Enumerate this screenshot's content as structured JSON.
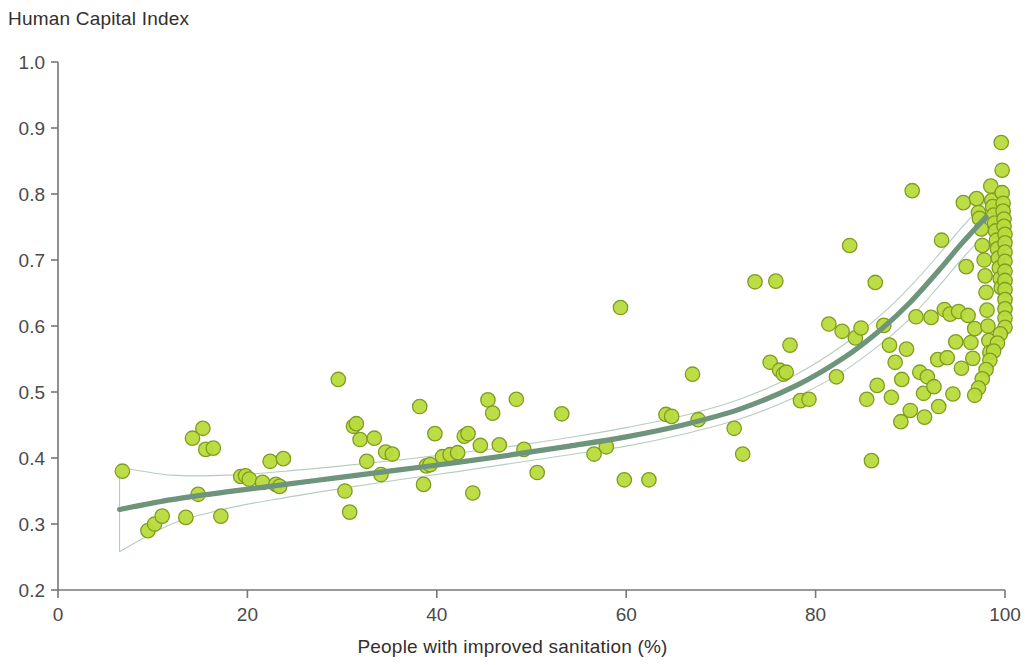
{
  "chart_data": {
    "type": "scatter",
    "title": "Human Capital Index",
    "xlabel": "People with improved sanitation (%)",
    "ylabel": "Human Capital Index",
    "xlim": [
      0,
      100
    ],
    "ylim": [
      0.2,
      1.0
    ],
    "xticks": [
      0,
      20,
      40,
      60,
      80,
      100
    ],
    "xtick_labels": [
      "0",
      "20",
      "40",
      "60",
      "80",
      "100"
    ],
    "yticks": [
      0.2,
      0.3,
      0.4,
      0.5,
      0.6,
      0.7,
      0.8,
      0.9,
      1.0
    ],
    "ytick_labels": [
      "0.2",
      "0.3",
      "0.4",
      "0.5",
      "0.6",
      "0.7",
      "0.8",
      "0.9",
      "1.0"
    ],
    "grid": false,
    "legend": null,
    "marker_fill": "#b8db3c",
    "marker_edge": "#7f9c20",
    "trend_color": "#6e947c",
    "band_color": "#a9c4b3",
    "axis_color": "#777777",
    "points": [
      [
        6.8,
        0.38
      ],
      [
        9.5,
        0.29
      ],
      [
        10.2,
        0.3
      ],
      [
        11.0,
        0.312
      ],
      [
        13.5,
        0.31
      ],
      [
        14.2,
        0.43
      ],
      [
        14.8,
        0.345
      ],
      [
        15.3,
        0.445
      ],
      [
        15.6,
        0.413
      ],
      [
        16.4,
        0.415
      ],
      [
        17.2,
        0.312
      ],
      [
        19.3,
        0.372
      ],
      [
        19.8,
        0.373
      ],
      [
        20.2,
        0.368
      ],
      [
        21.6,
        0.363
      ],
      [
        22.4,
        0.395
      ],
      [
        23.0,
        0.36
      ],
      [
        23.4,
        0.357
      ],
      [
        23.8,
        0.399
      ],
      [
        29.6,
        0.519
      ],
      [
        30.3,
        0.35
      ],
      [
        30.8,
        0.318
      ],
      [
        31.2,
        0.448
      ],
      [
        31.5,
        0.452
      ],
      [
        31.9,
        0.428
      ],
      [
        32.6,
        0.395
      ],
      [
        33.4,
        0.43
      ],
      [
        34.1,
        0.375
      ],
      [
        34.6,
        0.409
      ],
      [
        35.3,
        0.406
      ],
      [
        38.2,
        0.478
      ],
      [
        38.6,
        0.36
      ],
      [
        38.9,
        0.388
      ],
      [
        39.3,
        0.39
      ],
      [
        39.8,
        0.437
      ],
      [
        40.6,
        0.402
      ],
      [
        41.4,
        0.405
      ],
      [
        42.2,
        0.408
      ],
      [
        42.9,
        0.433
      ],
      [
        43.3,
        0.437
      ],
      [
        43.8,
        0.347
      ],
      [
        44.6,
        0.419
      ],
      [
        45.4,
        0.488
      ],
      [
        45.9,
        0.468
      ],
      [
        46.6,
        0.42
      ],
      [
        48.4,
        0.489
      ],
      [
        49.2,
        0.413
      ],
      [
        50.6,
        0.378
      ],
      [
        53.2,
        0.467
      ],
      [
        56.6,
        0.406
      ],
      [
        57.9,
        0.417
      ],
      [
        59.4,
        0.628
      ],
      [
        59.8,
        0.367
      ],
      [
        62.4,
        0.367
      ],
      [
        64.2,
        0.466
      ],
      [
        64.8,
        0.463
      ],
      [
        67.0,
        0.527
      ],
      [
        67.6,
        0.458
      ],
      [
        71.4,
        0.445
      ],
      [
        72.3,
        0.406
      ],
      [
        73.6,
        0.667
      ],
      [
        75.2,
        0.545
      ],
      [
        75.8,
        0.668
      ],
      [
        76.2,
        0.533
      ],
      [
        76.6,
        0.527
      ],
      [
        76.9,
        0.53
      ],
      [
        77.3,
        0.571
      ],
      [
        78.4,
        0.487
      ],
      [
        79.3,
        0.489
      ],
      [
        81.4,
        0.603
      ],
      [
        82.2,
        0.523
      ],
      [
        82.8,
        0.592
      ],
      [
        83.6,
        0.722
      ],
      [
        84.2,
        0.582
      ],
      [
        84.8,
        0.597
      ],
      [
        85.4,
        0.489
      ],
      [
        85.9,
        0.396
      ],
      [
        86.3,
        0.666
      ],
      [
        87.2,
        0.601
      ],
      [
        87.8,
        0.571
      ],
      [
        88.4,
        0.545
      ],
      [
        89.1,
        0.519
      ],
      [
        89.6,
        0.565
      ],
      [
        90.2,
        0.805
      ],
      [
        90.6,
        0.614
      ],
      [
        91.0,
        0.53
      ],
      [
        91.4,
        0.498
      ],
      [
        91.8,
        0.523
      ],
      [
        92.2,
        0.613
      ],
      [
        92.5,
        0.508
      ],
      [
        92.9,
        0.549
      ],
      [
        93.3,
        0.73
      ],
      [
        93.6,
        0.625
      ],
      [
        93.9,
        0.552
      ],
      [
        94.2,
        0.618
      ],
      [
        94.5,
        0.497
      ],
      [
        94.8,
        0.576
      ],
      [
        95.1,
        0.622
      ],
      [
        95.4,
        0.536
      ],
      [
        95.6,
        0.787
      ],
      [
        95.9,
        0.69
      ],
      [
        96.1,
        0.616
      ],
      [
        96.4,
        0.575
      ],
      [
        96.6,
        0.551
      ],
      [
        96.8,
        0.596
      ],
      [
        97.0,
        0.793
      ],
      [
        97.2,
        0.772
      ],
      [
        97.3,
        0.763
      ],
      [
        97.5,
        0.747
      ],
      [
        97.6,
        0.722
      ],
      [
        97.8,
        0.7
      ],
      [
        97.9,
        0.676
      ],
      [
        98.0,
        0.651
      ],
      [
        98.1,
        0.624
      ],
      [
        98.2,
        0.6
      ],
      [
        98.3,
        0.578
      ],
      [
        98.4,
        0.56
      ],
      [
        98.5,
        0.812
      ],
      [
        98.6,
        0.79
      ],
      [
        98.7,
        0.781
      ],
      [
        98.8,
        0.768
      ],
      [
        98.9,
        0.756
      ],
      [
        99.0,
        0.744
      ],
      [
        99.1,
        0.73
      ],
      [
        99.2,
        0.717
      ],
      [
        99.3,
        0.703
      ],
      [
        99.4,
        0.688
      ],
      [
        99.5,
        0.672
      ],
      [
        99.6,
        0.658
      ],
      [
        99.6,
        0.878
      ],
      [
        99.7,
        0.836
      ],
      [
        99.7,
        0.802
      ],
      [
        99.8,
        0.786
      ],
      [
        99.8,
        0.774
      ],
      [
        99.9,
        0.762
      ],
      [
        99.9,
        0.751
      ],
      [
        100.0,
        0.739
      ],
      [
        100.0,
        0.726
      ],
      [
        100.0,
        0.712
      ],
      [
        100.0,
        0.698
      ],
      [
        100.0,
        0.683
      ],
      [
        100.0,
        0.669
      ],
      [
        100.0,
        0.655
      ],
      [
        100.0,
        0.64
      ],
      [
        100.0,
        0.626
      ],
      [
        100.0,
        0.612
      ],
      [
        100.0,
        0.598
      ],
      [
        99.5,
        0.588
      ],
      [
        99.2,
        0.574
      ],
      [
        98.8,
        0.562
      ],
      [
        98.4,
        0.548
      ],
      [
        98.0,
        0.534
      ],
      [
        97.6,
        0.52
      ],
      [
        97.2,
        0.506
      ],
      [
        96.8,
        0.495
      ],
      [
        93.0,
        0.478
      ],
      [
        91.5,
        0.462
      ],
      [
        89.0,
        0.455
      ],
      [
        88.0,
        0.492
      ],
      [
        86.5,
        0.51
      ],
      [
        90.0,
        0.472
      ]
    ],
    "trend": {
      "x": [
        6.5,
        12,
        18,
        24,
        30,
        36,
        42,
        48,
        54,
        60,
        66,
        72,
        78,
        83,
        87,
        90,
        93,
        95,
        96.5,
        98
      ],
      "y": [
        0.322,
        0.337,
        0.349,
        0.36,
        0.371,
        0.382,
        0.393,
        0.405,
        0.418,
        0.432,
        0.45,
        0.474,
        0.51,
        0.552,
        0.596,
        0.636,
        0.684,
        0.718,
        0.742,
        0.765
      ]
    },
    "band_upper": {
      "x": [
        6.5,
        12,
        18,
        24,
        30,
        36,
        42,
        48,
        54,
        60,
        66,
        72,
        78,
        83,
        87,
        90,
        93,
        95,
        96.5,
        98
      ],
      "y": [
        0.386,
        0.374,
        0.374,
        0.38,
        0.388,
        0.397,
        0.407,
        0.418,
        0.431,
        0.446,
        0.464,
        0.489,
        0.527,
        0.572,
        0.618,
        0.66,
        0.708,
        0.742,
        0.766,
        0.79
      ]
    },
    "band_lower": {
      "x": [
        6.5,
        12,
        18,
        24,
        30,
        36,
        42,
        48,
        54,
        60,
        66,
        72,
        78,
        83,
        87,
        90,
        93,
        95,
        96.5,
        98
      ],
      "y": [
        0.258,
        0.3,
        0.324,
        0.34,
        0.354,
        0.367,
        0.379,
        0.392,
        0.405,
        0.418,
        0.436,
        0.459,
        0.493,
        0.532,
        0.574,
        0.612,
        0.66,
        0.694,
        0.718,
        0.74
      ]
    }
  }
}
